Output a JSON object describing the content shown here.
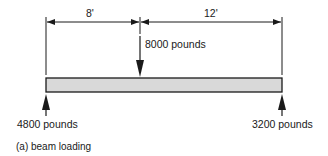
{
  "figure": {
    "caption": "(a) beam loading",
    "dimensions": [
      {
        "label": "8'",
        "from": "left support",
        "to": "point load"
      },
      {
        "label": "12'",
        "from": "point load",
        "to": "right support"
      }
    ],
    "loads": {
      "applied": {
        "label": "8000 pounds",
        "direction": "down"
      },
      "left_reaction": {
        "label": "4800 pounds",
        "direction": "up"
      },
      "right_reaction": {
        "label": "3200 pounds",
        "direction": "up"
      }
    },
    "colors": {
      "beam_fill": "#d9d9d9",
      "stroke": "#1a1a1a"
    }
  }
}
